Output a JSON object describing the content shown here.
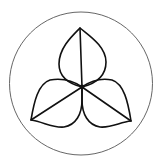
{
  "logo": {
    "alt": "Three-petal trillium flower inside a circle",
    "colors": {
      "background": "#ffffff",
      "circle_stroke": "#555555",
      "petal_stroke": "#111111"
    }
  }
}
